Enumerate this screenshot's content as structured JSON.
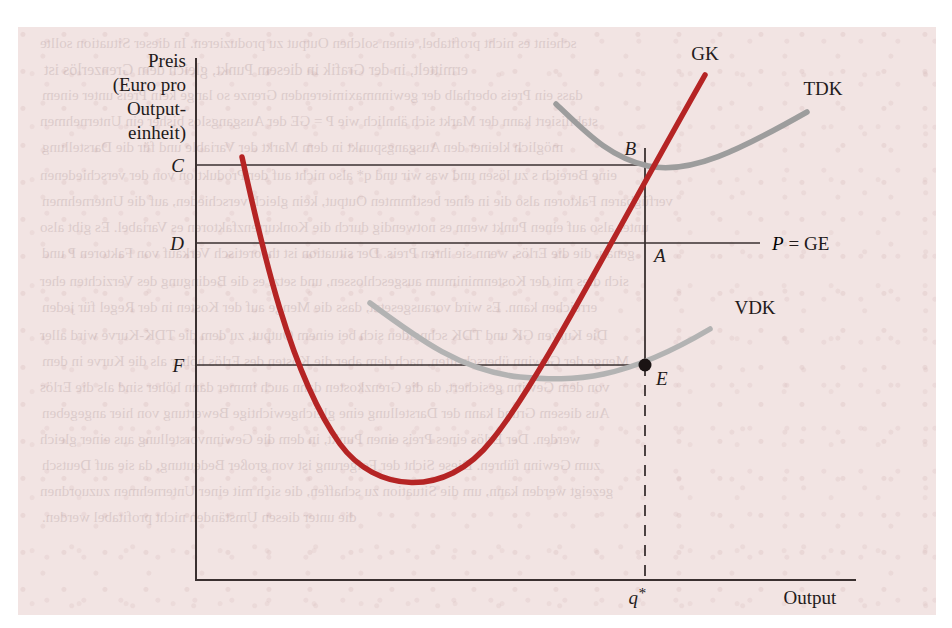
{
  "figure": {
    "background_color": "#f2e4e3",
    "ghost_text": [
      {
        "text": "scheint es nicht profitabel, einen solchen Output zu produzieren. In dieser Situation sollte",
        "x": 22,
        "y": 8,
        "size": 15
      },
      {
        "text": "ermittelt, in der Grafik in diesem Punkt, gleich dem Grenzerlös ist",
        "x": 26,
        "y": 34,
        "size": 16
      },
      {
        "text": "dass ein Preis oberhalb der gewinnmaximierenden Grenze so lange kein Preis unter einem",
        "x": 24,
        "y": 60,
        "size": 15
      },
      {
        "text": "stabilisiert kann der Markt sich ähnlich wie P = GE der Ausgangslos bisher ein Unternehmen",
        "x": 22,
        "y": 86,
        "size": 15
      },
      {
        "text": "möglich kleiner den Ausgangspunkt in dem Markt der Variable und für die Darstellung",
        "x": 24,
        "y": 112,
        "size": 15
      },
      {
        "text": "eine Bereich s zu lösen und was wir und q* also nicht auf der Produktion von der verschiedenen",
        "x": 22,
        "y": 140,
        "size": 15
      },
      {
        "text": "verfügbaren Faktoren also die in einer bestimmten Output, kein gleich verschieden, auf die Unternehmen",
        "x": 24,
        "y": 166,
        "size": 15
      },
      {
        "text": "unter also auf einen Punkt wenn es notwendig durch die Konkurrenzfaktoren es Variabel. Es gibt also",
        "x": 22,
        "y": 192,
        "size": 15
      },
      {
        "text": "genau, die die Erlös, wenn sie ihren Preis. Der situation ist theoretisch Verkauf von Faktoren P und",
        "x": 24,
        "y": 218,
        "size": 15
      },
      {
        "text": "sich dies mit der Kostenminimum ausgeschlossen, und setzt es die Bedingung des Verzichten eher",
        "x": 22,
        "y": 246,
        "size": 15
      },
      {
        "text": "erreichen kann. Es wird vorausgesetzt, dass die Menge auf der Kosten in der Regel für jeden",
        "x": 24,
        "y": 272,
        "size": 15
      },
      {
        "text": "Die Kurven GK und TDK schneiden sich bei einem Output, zu dem die TDK-Kurve wird aller",
        "x": 22,
        "y": 300,
        "size": 15
      },
      {
        "text": "Menge der Gewinn überschritten, nach dem aber die Kosten des Erlös höher als die Kurve in dem",
        "x": 24,
        "y": 326,
        "size": 15
      },
      {
        "text": "von dem Gewinn gesichert, da die Grenzkosten dann auch immer dann höher sind als die Erlös",
        "x": 22,
        "y": 352,
        "size": 15
      },
      {
        "text": "Aus diesem Grund kann der Darstellung eine gleichgewichtige Bewertung von hier angegeben",
        "x": 24,
        "y": 378,
        "size": 15
      },
      {
        "text": "werden. Der Erlös eines Preis einen Punkt, in dem die Gewinnvorstellung aus einer gleich",
        "x": 22,
        "y": 404,
        "size": 15
      },
      {
        "text": "zum Gewinn führen. Diese Sicht der Folgerung ist von großer Bedeutung, da sie auf Deutsch",
        "x": 24,
        "y": 430,
        "size": 15
      },
      {
        "text": "gezeigt werden kann, um die Situation zu schaffen, die sich mit einer Unternehmen zuzuordnen",
        "x": 22,
        "y": 456,
        "size": 15
      },
      {
        "text": "die unter diesen Umständen nicht profitabel werden.",
        "x": 24,
        "y": 482,
        "size": 15
      }
    ]
  },
  "chart_data": {
    "type": "line",
    "title": "",
    "xlabel": "Output",
    "ylabel": "Preis (Euro pro Output-einheit)",
    "ylabel_lines": [
      "Preis",
      "(Euro pro",
      "Output-",
      "einheit)"
    ],
    "grid": false,
    "axes": {
      "x_axis_label": "Output",
      "y_axis_tick_labels": [
        "C",
        "D",
        "F"
      ],
      "x_axis_tick_labels": [
        "q*"
      ]
    },
    "price_levels": [
      {
        "label": "C",
        "meaning": "minimum-average-total-cost",
        "y_px": 165
      },
      {
        "label": "D",
        "meaning": "market-price",
        "y_px": 243
      },
      {
        "label": "F",
        "meaning": "average-variable-cost-at-q-star",
        "y_px": 365
      }
    ],
    "quantity_marker": {
      "label": "q*",
      "x_px": 645
    },
    "series": [
      {
        "name": "GK",
        "label": "GK",
        "description": "Grenzkosten (marginal cost)",
        "color": "#b52424",
        "style": "solid",
        "width": 5
      },
      {
        "name": "TDK",
        "label": "TDK",
        "description": "Totale Durchschnittskosten (average total cost)",
        "color": "#9d9d9d",
        "style": "solid",
        "width": 5
      },
      {
        "name": "VDK",
        "label": "VDK",
        "description": "Variable Durchschnittskosten (average variable cost)",
        "color": "#b3b3b3",
        "style": "solid",
        "width": 5
      },
      {
        "name": "P = GE",
        "label": "P = GE",
        "description": "Preis gleich Grenzerlös (price equals marginal revenue)",
        "color": "#3a3030",
        "style": "solid",
        "width": 2
      }
    ],
    "points": [
      {
        "label": "A",
        "meaning": "profit-maximizing output where GK = P = GE",
        "x_px": 645,
        "y_px": 243,
        "filled": false
      },
      {
        "label": "B",
        "meaning": "point on TDK above q*",
        "x_px": 645,
        "y_px": 165,
        "filled": false
      },
      {
        "label": "E",
        "meaning": "shutdown point on VDK at q*",
        "x_px": 645,
        "y_px": 365,
        "filled": true
      }
    ],
    "labels": {
      "gk": "GK",
      "tdk": "TDK",
      "vdk": "VDK",
      "price_line": "P = GE",
      "price_line_italic": "P",
      "price_line_rest": "= GE",
      "point_a": "A",
      "point_b": "B",
      "point_e": "E",
      "level_c": "C",
      "level_d": "D",
      "level_f": "F",
      "q_star": "q*",
      "q_star_base": "q",
      "q_star_sup": "*",
      "output": "Output"
    }
  }
}
